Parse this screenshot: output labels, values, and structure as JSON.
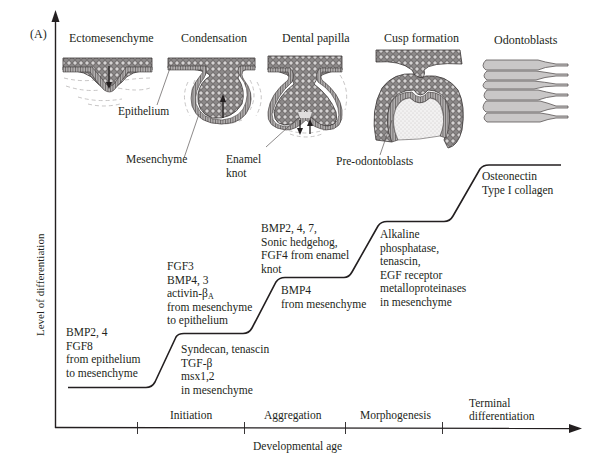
{
  "panel_label": "(A)",
  "axes": {
    "y_label": "Level of differentiation",
    "x_label": "Developmental age"
  },
  "stages": [
    {
      "title": "Ectomesenchyme"
    },
    {
      "title": "Condensation"
    },
    {
      "title": "Dental papilla"
    },
    {
      "title": "Cusp formation"
    },
    {
      "title": "Odontoblasts"
    }
  ],
  "illustration_labels": {
    "epithelium": "Epithelium",
    "mesenchyme": "Mesenchyme",
    "enamel_knot_1": "Enamel",
    "enamel_knot_2": "knot",
    "pre_odontoblasts": "Pre-odontoblasts"
  },
  "phases": [
    {
      "label": "Initiation"
    },
    {
      "label": "Aggregation"
    },
    {
      "label": "Morphogenesis"
    },
    {
      "label_line1": "Terminal",
      "label_line2": "differentiation"
    }
  ],
  "annotations": {
    "step0_above": [
      "BMP2, 4",
      "FGF8",
      "from epithelium",
      "to mesenchyme"
    ],
    "step1_above": [
      "FGF3",
      "BMP4, 3",
      "activin-β",
      "from mesenchyme",
      "to epithelium"
    ],
    "step1_above_sub": "A",
    "step1_below": [
      "Syndecan, tenascin",
      "TGF-β",
      "msx1,2",
      "in mesenchyme"
    ],
    "step2_above": [
      "BMP2, 4, 7,",
      "Sonic hedgehog,",
      "FGF4 from enamel",
      "knot"
    ],
    "step2_below": [
      "BMP4",
      "from mesenchyme"
    ],
    "step3_below": [
      "Alkaline",
      "phosphatase,",
      "tenascin,",
      "EGF receptor",
      "metalloproteinases",
      "in mesenchyme"
    ],
    "step4_below": [
      "Osteonectin",
      "Type I collagen"
    ]
  },
  "colors": {
    "ink": "#231f20",
    "tissue_dark": "#6d6a6a",
    "tissue_mid": "#a8a5a5",
    "cell_fill": "#c9c7c7",
    "faint": "#b9b6b6"
  }
}
